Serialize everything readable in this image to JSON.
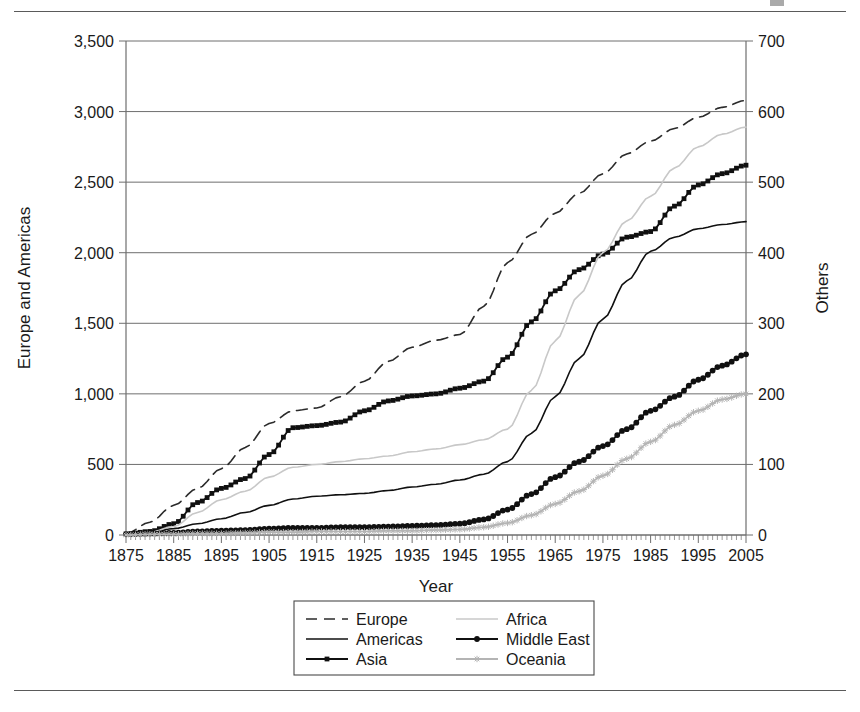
{
  "page": {
    "has_top_rule": true,
    "has_bottom_rule": true,
    "corner_mark": "page-corner-mark"
  },
  "chart_data": {
    "type": "line",
    "title": "",
    "xlabel": "Year",
    "ylabel": "Europe and Americas",
    "y2label": "Others",
    "xlim": [
      1875,
      2005
    ],
    "ylim": [
      0,
      3500
    ],
    "y2lim": [
      0,
      700
    ],
    "grid": true,
    "legend_position": "bottom-center",
    "xticks": [
      1875,
      1885,
      1895,
      1905,
      1915,
      1925,
      1935,
      1945,
      1955,
      1965,
      1975,
      1985,
      1995,
      2005
    ],
    "xtick_labels": [
      "1875",
      "1885",
      "1895",
      "1905",
      "1915",
      "1925",
      "1935",
      "1945",
      "1955",
      "1965",
      "1975",
      "1985",
      "1995",
      "2005"
    ],
    "yticks": [
      0,
      500,
      1000,
      1500,
      2000,
      2500,
      3000,
      3500
    ],
    "ytick_labels": [
      "0",
      "500",
      "1,000",
      "1,500",
      "2,000",
      "2,500",
      "3,000",
      "3,500"
    ],
    "y2ticks": [
      0,
      100,
      200,
      300,
      400,
      500,
      600,
      700
    ],
    "y2tick_labels": [
      "0",
      "100",
      "200",
      "300",
      "400",
      "500",
      "600",
      "700"
    ],
    "x": [
      1875,
      1880,
      1885,
      1890,
      1895,
      1900,
      1905,
      1910,
      1915,
      1920,
      1925,
      1930,
      1935,
      1940,
      1945,
      1950,
      1955,
      1960,
      1965,
      1970,
      1975,
      1980,
      1985,
      1990,
      1995,
      2000,
      2005
    ],
    "series": [
      {
        "name": "Europe",
        "axis": "left",
        "style": "dashed",
        "marker": "none",
        "color": "#2b2b2b",
        "values": [
          10,
          90,
          210,
          330,
          470,
          620,
          790,
          880,
          900,
          980,
          1090,
          1230,
          1330,
          1380,
          1420,
          1620,
          1930,
          2130,
          2280,
          2420,
          2560,
          2700,
          2790,
          2880,
          2960,
          3030,
          3080
        ]
      },
      {
        "name": "Americas",
        "axis": "left",
        "style": "solid",
        "marker": "none",
        "color": "#101010",
        "values": [
          5,
          20,
          45,
          80,
          115,
          160,
          210,
          255,
          275,
          285,
          295,
          315,
          340,
          360,
          390,
          430,
          520,
          720,
          980,
          1250,
          1530,
          1800,
          2010,
          2110,
          2170,
          2200,
          2220
        ]
      },
      {
        "name": "Asia",
        "axis": "left",
        "style": "solid",
        "marker": "square",
        "color": "#101010",
        "values": [
          8,
          25,
          80,
          230,
          330,
          400,
          570,
          760,
          775,
          800,
          880,
          950,
          985,
          1000,
          1040,
          1090,
          1260,
          1510,
          1730,
          1880,
          1990,
          2110,
          2150,
          2330,
          2480,
          2560,
          2620
        ]
      },
      {
        "name": "Africa",
        "axis": "right",
        "style": "solid",
        "marker": "none",
        "color": "#c8c8c8",
        "values": [
          1,
          4,
          12,
          32,
          50,
          62,
          82,
          96,
          100,
          104,
          108,
          112,
          118,
          122,
          128,
          135,
          150,
          205,
          275,
          340,
          400,
          445,
          480,
          520,
          550,
          568,
          578
        ]
      },
      {
        "name": "Middle East",
        "axis": "right",
        "style": "solid",
        "marker": "circle",
        "color": "#101010",
        "values": [
          1,
          2,
          3,
          5,
          6,
          7,
          9,
          10,
          10,
          11,
          11,
          12,
          13,
          14,
          16,
          22,
          36,
          58,
          82,
          104,
          126,
          150,
          176,
          196,
          220,
          240,
          256
        ]
      },
      {
        "name": "Oceania",
        "axis": "right",
        "style": "solid",
        "marker": "star",
        "color": "#b4b4b4",
        "values": [
          0,
          1,
          1,
          2,
          2,
          3,
          4,
          4,
          5,
          5,
          5,
          6,
          6,
          7,
          8,
          11,
          17,
          28,
          44,
          62,
          84,
          108,
          132,
          156,
          176,
          192,
          200
        ]
      }
    ]
  },
  "legend": {
    "entries": [
      {
        "label": "Europe",
        "key": "legend-item-europe"
      },
      {
        "label": "Africa",
        "key": "legend-item-africa"
      },
      {
        "label": "Americas",
        "key": "legend-item-americas"
      },
      {
        "label": "Middle East",
        "key": "legend-item-middle-east"
      },
      {
        "label": "Asia",
        "key": "legend-item-asia"
      },
      {
        "label": "Oceania",
        "key": "legend-item-oceania"
      }
    ]
  }
}
